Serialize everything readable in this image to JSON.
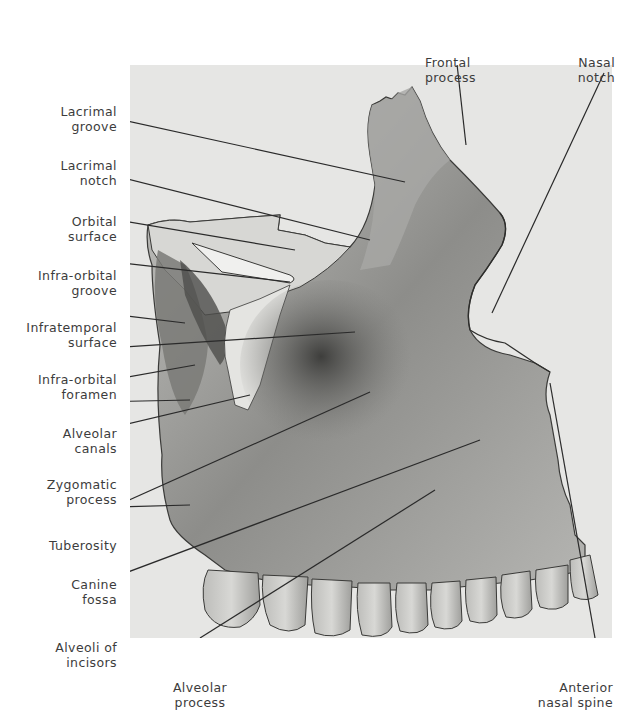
{
  "figure": {
    "colors": {
      "panel_bg": "#e6e6e4",
      "bone_light": "#cfcfcc",
      "bone_mid": "#9a9a97",
      "bone_dark": "#4a4a48",
      "leader": "#2a2a2a",
      "text": "#3c3c3c"
    }
  },
  "labels": {
    "left": [
      {
        "line1": "Lacrimal",
        "line2": "groove"
      },
      {
        "line1": "Lacrimal",
        "line2": "notch"
      },
      {
        "line1": "Orbital",
        "line2": "surface"
      },
      {
        "line1": "Infra-orbital",
        "line2": "groove"
      },
      {
        "line1": "Infratemporal",
        "line2": "surface"
      },
      {
        "line1": "Infra-orbital",
        "line2": "foramen"
      },
      {
        "line1": "Alveolar",
        "line2": "canals"
      },
      {
        "line1": "Zygomatic",
        "line2": "process"
      },
      {
        "line1": "Tuberosity",
        "line2": ""
      },
      {
        "line1": "Canine",
        "line2": "fossa"
      },
      {
        "line1": "Alveoli of",
        "line2": "incisors"
      }
    ],
    "top": [
      {
        "line1": "Frontal",
        "line2": "process"
      },
      {
        "line1": "Nasal",
        "line2": "notch"
      }
    ],
    "bottom": [
      {
        "line1": "Alveolar",
        "line2": "process"
      },
      {
        "line1": "Anterior",
        "line2": "nasal spine"
      }
    ]
  }
}
